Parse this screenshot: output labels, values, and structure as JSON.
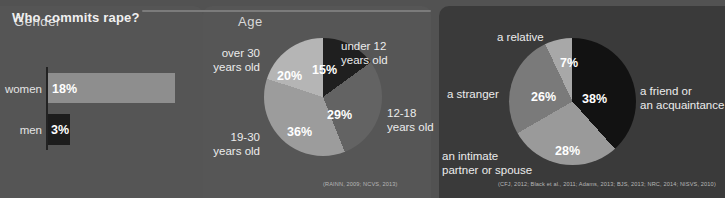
{
  "header": {
    "title": "WHO ARE THE VICTIMS?"
  },
  "panels": {
    "gender": {
      "label": "Gender"
    },
    "age": {
      "label": "Age"
    },
    "perpetrator": {
      "title": "Who commits rape?"
    }
  },
  "citations": {
    "age": "(RAINN, 2009; NCVS, 2013)",
    "perpetrator": "(CFJ, 2012; Black et al., 2011; Adams, 2013; BJS, 2013; NRC, 2014; NISVS, 2010)"
  },
  "colors": {
    "page_background": "#525252",
    "panel_left": "#555555",
    "panel_mid": "#565656",
    "panel_right": "#3a3a3a",
    "bar_women": "#8e8e8e",
    "bar_men": "#1d1d1d",
    "axis": "#232323",
    "text": "#e8e8e8"
  },
  "chart_data": [
    {
      "type": "bar",
      "title": "Gender",
      "orientation": "horizontal",
      "categories": [
        "women",
        "men"
      ],
      "values": [
        18,
        3
      ],
      "value_labels": [
        "18%",
        "3%"
      ],
      "unit": "%",
      "xlabel": "",
      "ylabel": "",
      "xlim": [
        0,
        25
      ],
      "grid": false,
      "legend": "none",
      "colors": [
        "#8e8e8e",
        "#1d1d1d"
      ]
    },
    {
      "type": "pie",
      "title": "Age",
      "labels": [
        "under 12 years old",
        "12-18 years old",
        "19-30 years old",
        "over 30 years old"
      ],
      "values": [
        15,
        29,
        36,
        20
      ],
      "value_labels": [
        "15%",
        "29%",
        "36%",
        "20%"
      ],
      "colors": [
        "#1f1f1f",
        "#636363",
        "#9c9c9c",
        "#b5b5b5"
      ],
      "legend": "outer-labels",
      "citation": "(RAINN, 2009; NCVS, 2013)"
    },
    {
      "type": "pie",
      "title": "Who commits rape?",
      "labels": [
        "a friend or an acquaintance",
        "an intimate partner or spouse",
        "a stranger",
        "a relative"
      ],
      "values": [
        38,
        28,
        26,
        7
      ],
      "value_labels": [
        "38%",
        "28%",
        "26%",
        "7%"
      ],
      "colors": [
        "#121212",
        "#9a9a9a",
        "#7a7a7a",
        "#a8a8a8"
      ],
      "legend": "outer-labels",
      "citation": "(CFJ, 2012; Black et al., 2011; Adams, 2013; BJS, 2013; NRC, 2014; NISVS, 2010)"
    }
  ],
  "labels": {
    "age_outer": {
      "under12": "under 12\nyears old",
      "a1218": "12-18\nyears old",
      "a1930": "19-30\nyears old",
      "over30": "over 30\nyears old"
    },
    "rape_outer": {
      "relative": "a relative",
      "stranger": "a stranger",
      "friend": "a friend or\nan acquaintance",
      "intimate": "an intimate\npartner or spouse"
    }
  }
}
